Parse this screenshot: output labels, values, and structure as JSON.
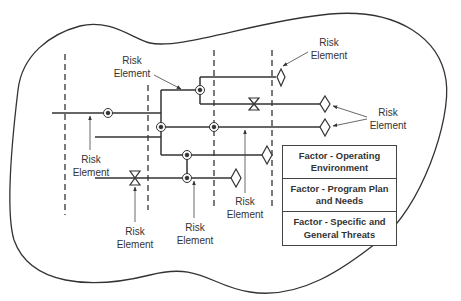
{
  "diagram": {
    "colors": {
      "line": "#333333",
      "text": "#333333",
      "background": "#ffffff"
    },
    "risk_label_line1": "Risk",
    "risk_label_line2": "Element",
    "risk_labels": [
      {
        "id": "top-left",
        "line1": "Risk",
        "line2": "Element"
      },
      {
        "id": "top-right",
        "line1": "Risk",
        "line2": "Element"
      },
      {
        "id": "right",
        "line1": "Risk",
        "line2": "Element"
      },
      {
        "id": "left",
        "line1": "Risk",
        "line2": "Element"
      },
      {
        "id": "bottom-bowtie",
        "line1": "Risk",
        "line2": "Element"
      },
      {
        "id": "bottom-node",
        "line1": "Risk",
        "line2": "Element"
      },
      {
        "id": "bottom-center",
        "line1": "Risk",
        "line2": "Element"
      }
    ],
    "factors": [
      {
        "line1": "Factor - Operating",
        "line2": "Environment"
      },
      {
        "line1": "Factor - Program Plan",
        "line2": "and Needs"
      },
      {
        "line1": "Factor - Specific and",
        "line2": "General Threats"
      }
    ],
    "symbols": {
      "node": "circle-junction",
      "valve": "bowtie",
      "terminal": "diamond"
    }
  }
}
